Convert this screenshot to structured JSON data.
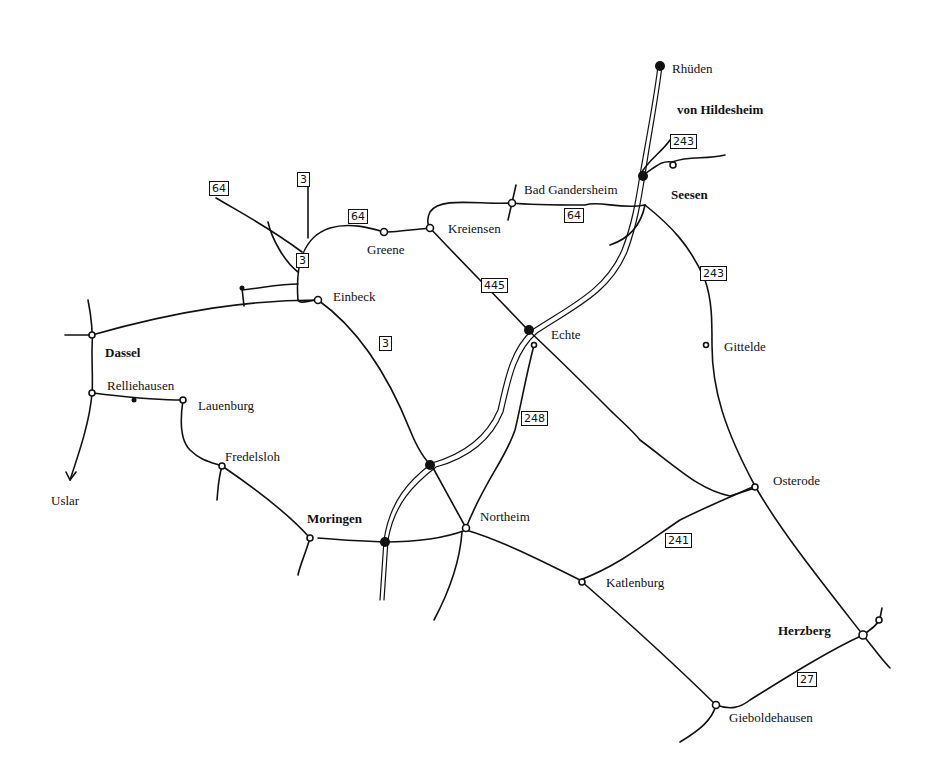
{
  "map": {
    "places": [
      {
        "id": "rhueden",
        "name": "Rhüden",
        "bold": false,
        "x": 672,
        "y": 62
      },
      {
        "id": "von-hildesheim",
        "name": "von Hildesheim",
        "bold": true,
        "x": 677,
        "y": 103
      },
      {
        "id": "seesen",
        "name": "Seesen",
        "bold": true,
        "x": 671,
        "y": 188
      },
      {
        "id": "bad-gandersheim",
        "name": "Bad Gandersheim",
        "bold": false,
        "x": 524,
        "y": 183
      },
      {
        "id": "kreiensen",
        "name": "Kreiensen",
        "bold": false,
        "x": 448,
        "y": 222
      },
      {
        "id": "greene",
        "name": "Greene",
        "bold": false,
        "x": 367,
        "y": 243
      },
      {
        "id": "einbeck",
        "name": "Einbeck",
        "bold": false,
        "x": 333,
        "y": 290
      },
      {
        "id": "echte",
        "name": "Echte",
        "bold": false,
        "x": 551,
        "y": 328
      },
      {
        "id": "gittelde",
        "name": "Gittelde",
        "bold": false,
        "x": 724,
        "y": 340
      },
      {
        "id": "dassel",
        "name": "Dassel",
        "bold": true,
        "x": 105,
        "y": 346
      },
      {
        "id": "relliehausen",
        "name": "Relliehausen",
        "bold": false,
        "x": 107,
        "y": 379
      },
      {
        "id": "lauenburg",
        "name": "Lauenburg",
        "bold": false,
        "x": 198,
        "y": 399
      },
      {
        "id": "fredelsloh",
        "name": "Fredelsloh",
        "bold": false,
        "x": 225,
        "y": 450
      },
      {
        "id": "uslar",
        "name": "Uslar",
        "bold": false,
        "x": 51,
        "y": 494
      },
      {
        "id": "osterode",
        "name": "Osterode",
        "bold": false,
        "x": 773,
        "y": 474
      },
      {
        "id": "moringen",
        "name": "Moringen",
        "bold": true,
        "x": 307,
        "y": 512
      },
      {
        "id": "northeim",
        "name": "Northeim",
        "bold": false,
        "x": 480,
        "y": 510
      },
      {
        "id": "katlenburg",
        "name": "Katlenburg",
        "bold": false,
        "x": 606,
        "y": 576
      },
      {
        "id": "herzberg",
        "name": "Herzberg",
        "bold": true,
        "x": 778,
        "y": 624
      },
      {
        "id": "gieboldehausen",
        "name": "Gieboldehausen",
        "bold": false,
        "x": 729,
        "y": 711
      }
    ],
    "route_shields": [
      {
        "id": "shield-243-north",
        "number": "243",
        "x": 670,
        "y": 134
      },
      {
        "id": "shield-64-west",
        "number": "64",
        "x": 209,
        "y": 181
      },
      {
        "id": "shield-3-north",
        "number": "3",
        "x": 297,
        "y": 172
      },
      {
        "id": "shield-64-greene",
        "number": "64",
        "x": 348,
        "y": 209
      },
      {
        "id": "shield-64-gandersheim",
        "number": "64",
        "x": 564,
        "y": 208
      },
      {
        "id": "shield-3-einbeck",
        "number": "3",
        "x": 296,
        "y": 253
      },
      {
        "id": "shield-445",
        "number": "445",
        "x": 481,
        "y": 278
      },
      {
        "id": "shield-243-gittelde",
        "number": "243",
        "x": 700,
        "y": 266
      },
      {
        "id": "shield-3-south",
        "number": "3",
        "x": 379,
        "y": 336
      },
      {
        "id": "shield-248",
        "number": "248",
        "x": 521,
        "y": 411
      },
      {
        "id": "shield-241",
        "number": "241",
        "x": 665,
        "y": 533
      },
      {
        "id": "shield-27",
        "number": "27",
        "x": 797,
        "y": 672
      }
    ]
  }
}
